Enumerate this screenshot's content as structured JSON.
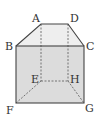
{
  "diagram": {
    "type": "prism-solid",
    "labels": {
      "A": "A",
      "B": "B",
      "C": "C",
      "D": "D",
      "E": "E",
      "F": "F",
      "G": "G",
      "H": "H"
    },
    "colors": {
      "front_face": "#dcdcdc",
      "top_face": "#eeeeee",
      "edge": "#555555"
    }
  }
}
